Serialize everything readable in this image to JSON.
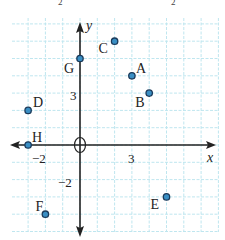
{
  "header_fragment": {
    "left": "2",
    "right": "2"
  },
  "axes": {
    "x_label": "x",
    "y_label": "y",
    "origin_label": "O"
  },
  "ticks": [
    {
      "axis": "y",
      "value": 3,
      "label": "3"
    },
    {
      "axis": "y",
      "value": -2,
      "label": "−2"
    },
    {
      "axis": "x",
      "value": -2,
      "label": "−2"
    },
    {
      "axis": "x",
      "value": 3,
      "label": "3"
    }
  ],
  "points": [
    {
      "label": "A",
      "x": 3,
      "y": 4
    },
    {
      "label": "B",
      "x": 4,
      "y": 3
    },
    {
      "label": "C",
      "x": 2,
      "y": 6
    },
    {
      "label": "D",
      "x": -3,
      "y": 2
    },
    {
      "label": "E",
      "x": 5,
      "y": -3
    },
    {
      "label": "F",
      "x": -2,
      "y": -4
    },
    {
      "label": "G",
      "x": 0,
      "y": 5
    },
    {
      "label": "H",
      "x": -3,
      "y": 0
    }
  ],
  "colors": {
    "grid": "#bfe6ef",
    "axis": "#222222",
    "point_fill": "#3a8fc4",
    "point_stroke": "#1b3a5a"
  }
}
